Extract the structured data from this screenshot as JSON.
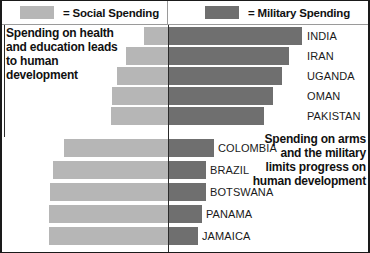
{
  "figure": {
    "width": 370,
    "height": 253,
    "colors": {
      "social": "#b6b6b6",
      "military": "#6f6f6f",
      "axis": "#2b2b2b",
      "text": "#111111"
    }
  },
  "legend": {
    "items": [
      {
        "name": "social-spending",
        "swatch_color": "#b6b6b6",
        "label": "= Social Spending"
      },
      {
        "name": "military-spending",
        "swatch_color": "#6f6f6f",
        "label": "= Military Spending"
      }
    ]
  },
  "annotations": {
    "left": "Spending on health and education leads to human development",
    "right": "Spending on arms and the military limits progress on human development"
  },
  "chart_data": {
    "type": "bar",
    "title": "",
    "subtitle": "",
    "xlabel": "",
    "ylabel": "",
    "orientation": "horizontal",
    "stacked": true,
    "grid": false,
    "legend_position": "top",
    "center_line_x_px": 166,
    "categories": [
      "INDIA",
      "IRAN",
      "UGANDA",
      "OMAN",
      "PAKISTAN",
      "COLOMBIA",
      "BRAZIL",
      "BOTSWANA",
      "PANAMA",
      "JAMAICA"
    ],
    "series": [
      {
        "name": "Social Spending",
        "color": "#b6b6b6",
        "values_px": [
          24,
          42,
          51,
          56,
          57,
          104,
          115,
          118,
          119,
          119
        ]
      },
      {
        "name": "Military Spending",
        "color": "#6f6f6f",
        "values_px": [
          134,
          121,
          114,
          105,
          96,
          46,
          38,
          38,
          34,
          30
        ]
      }
    ],
    "bar_geometry_px": [
      {
        "category": "INDIA",
        "y": 2,
        "social_start": 142,
        "social_end": 166,
        "military_start": 166,
        "military_end": 300
      },
      {
        "category": "IRAN",
        "y": 22,
        "social_start": 124,
        "social_end": 166,
        "military_start": 166,
        "military_end": 287
      },
      {
        "category": "UGANDA",
        "y": 42,
        "social_start": 115,
        "social_end": 166,
        "military_start": 166,
        "military_end": 280
      },
      {
        "category": "OMAN",
        "y": 62,
        "social_start": 110,
        "social_end": 166,
        "military_start": 166,
        "military_end": 271
      },
      {
        "category": "PAKISTAN",
        "y": 82,
        "social_start": 109,
        "social_end": 166,
        "military_start": 166,
        "military_end": 262
      },
      {
        "category": "COLOMBIA",
        "y": 114,
        "social_start": 62,
        "social_end": 166,
        "military_start": 166,
        "military_end": 212
      },
      {
        "category": "BRAZIL",
        "y": 136,
        "social_start": 51,
        "social_end": 166,
        "military_start": 166,
        "military_end": 204
      },
      {
        "category": "BOTSWANA",
        "y": 158,
        "social_start": 48,
        "social_end": 166,
        "military_start": 166,
        "military_end": 204
      },
      {
        "category": "PANAMA",
        "y": 180,
        "social_start": 47,
        "social_end": 166,
        "military_start": 166,
        "military_end": 200
      },
      {
        "category": "JAMAICA",
        "y": 202,
        "social_start": 47,
        "social_end": 166,
        "military_start": 166,
        "military_end": 196
      }
    ],
    "label_x_px": [
      305,
      305,
      305,
      305,
      305,
      216,
      208,
      208,
      204,
      200
    ]
  }
}
